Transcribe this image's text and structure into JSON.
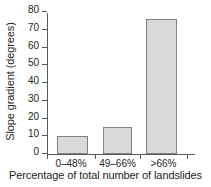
{
  "chart_data": {
    "type": "bar",
    "title": "",
    "categories": [
      "0–48%",
      "49–66%",
      ">66%"
    ],
    "values": [
      10,
      15,
      76
    ],
    "series": [
      {
        "name": "Slope gradient",
        "values": [
          10,
          15,
          76
        ]
      }
    ],
    "xlabel": "Percentage of total number of landslides",
    "ylabel": "Slope gradient (degrees)",
    "ylim": [
      0,
      80
    ],
    "yticks": [
      0,
      10,
      20,
      30,
      40,
      50,
      60,
      70,
      80
    ],
    "ytick_labels": [
      "0",
      "10",
      "20",
      "30",
      "40",
      "50",
      "60",
      "70",
      "80"
    ],
    "grid": false,
    "legend": false,
    "legend_position": "none",
    "bar_fill_color": "#d9d9d9",
    "bar_edge_color": "#808285",
    "axis_color": "#58595b",
    "background_color": "#ffffff"
  }
}
